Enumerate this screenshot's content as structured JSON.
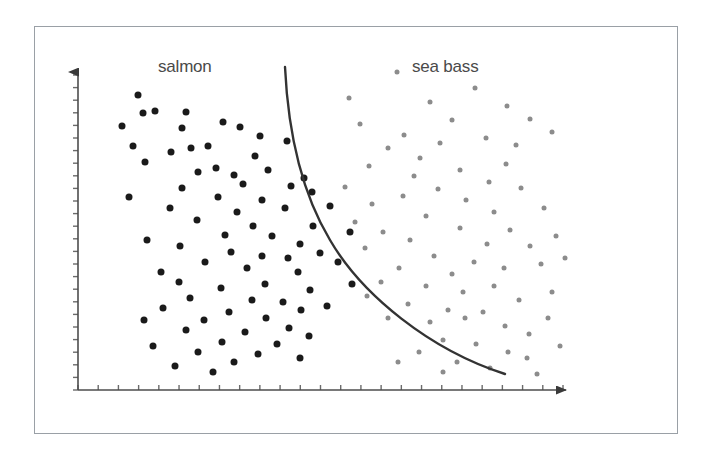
{
  "figure": {
    "title": "",
    "labels": {
      "salmon": "salmon",
      "sea_bass": "sea bass"
    },
    "colors": {
      "salmon_points": "#1a1a1a",
      "sea_bass_points": "#8c8c8c",
      "decision_boundary": "#333333",
      "axis": "#4d4d4d",
      "frame_border": "#9aa0a6",
      "background": "#ffffff",
      "label_text": "#4a4a4a"
    }
  },
  "chart_data": {
    "type": "scatter",
    "title": "",
    "xlabel": "",
    "ylabel": "",
    "grid": false,
    "legend_position": "in-plot-top",
    "axis_style": "arrow-axes-with-ticks",
    "xlim": [
      78,
      575
    ],
    "ylim": [
      63,
      390
    ],
    "annotations": [
      {
        "text": "salmon",
        "x": 188,
        "y": 66
      },
      {
        "text": "sea bass",
        "x": 448,
        "y": 66
      }
    ],
    "series": [
      {
        "name": "salmon",
        "color": "#1a1a1a",
        "marker": "circle",
        "marker_size": 7,
        "count": 78,
        "points": [
          [
            138,
            95
          ],
          [
            143,
            113
          ],
          [
            155,
            111
          ],
          [
            122,
            126
          ],
          [
            186,
            112
          ],
          [
            182,
            128
          ],
          [
            133,
            146
          ],
          [
            223,
            122
          ],
          [
            191,
            148
          ],
          [
            240,
            127
          ],
          [
            208,
            146
          ],
          [
            260,
            136
          ],
          [
            171,
            152
          ],
          [
            255,
            156
          ],
          [
            216,
            168
          ],
          [
            145,
            162
          ],
          [
            287,
            141
          ],
          [
            234,
            175
          ],
          [
            198,
            172
          ],
          [
            268,
            170
          ],
          [
            304,
            178
          ],
          [
            182,
            188
          ],
          [
            243,
            184
          ],
          [
            291,
            186
          ],
          [
            129,
            197
          ],
          [
            218,
            197
          ],
          [
            262,
            200
          ],
          [
            170,
            208
          ],
          [
            312,
            192
          ],
          [
            237,
            212
          ],
          [
            285,
            208
          ],
          [
            197,
            220
          ],
          [
            253,
            226
          ],
          [
            330,
            206
          ],
          [
            225,
            235
          ],
          [
            147,
            240
          ],
          [
            272,
            236
          ],
          [
            313,
            226
          ],
          [
            180,
            246
          ],
          [
            300,
            244
          ],
          [
            350,
            232
          ],
          [
            231,
            252
          ],
          [
            262,
            256
          ],
          [
            288,
            258
          ],
          [
            205,
            262
          ],
          [
            320,
            253
          ],
          [
            161,
            272
          ],
          [
            247,
            268
          ],
          [
            298,
            272
          ],
          [
            179,
            282
          ],
          [
            265,
            284
          ],
          [
            338,
            262
          ],
          [
            221,
            288
          ],
          [
            310,
            290
          ],
          [
            190,
            298
          ],
          [
            252,
            300
          ],
          [
            283,
            302
          ],
          [
            352,
            284
          ],
          [
            163,
            308
          ],
          [
            229,
            312
          ],
          [
            301,
            310
          ],
          [
            204,
            320
          ],
          [
            266,
            318
          ],
          [
            327,
            306
          ],
          [
            186,
            330
          ],
          [
            245,
            332
          ],
          [
            289,
            328
          ],
          [
            222,
            342
          ],
          [
            153,
            346
          ],
          [
            277,
            344
          ],
          [
            309,
            336
          ],
          [
            198,
            352
          ],
          [
            258,
            354
          ],
          [
            234,
            362
          ],
          [
            175,
            366
          ],
          [
            300,
            358
          ],
          [
            213,
            372
          ],
          [
            144,
            320
          ]
        ]
      },
      {
        "name": "sea bass",
        "color": "#8c8c8c",
        "marker": "circle",
        "marker_size": 5,
        "count": 72,
        "points": [
          [
            397,
            72
          ],
          [
            349,
            98
          ],
          [
            404,
            135
          ],
          [
            430,
            102
          ],
          [
            475,
            88
          ],
          [
            360,
            124
          ],
          [
            420,
            158
          ],
          [
            452,
            120
          ],
          [
            388,
            148
          ],
          [
            507,
            106
          ],
          [
            369,
            166
          ],
          [
            440,
            143
          ],
          [
            486,
            138
          ],
          [
            506,
            164
          ],
          [
            530,
            119
          ],
          [
            414,
            176
          ],
          [
            460,
            170
          ],
          [
            345,
            187
          ],
          [
            489,
            182
          ],
          [
            516,
            145
          ],
          [
            403,
            196
          ],
          [
            438,
            189
          ],
          [
            552,
            132
          ],
          [
            372,
            204
          ],
          [
            466,
            200
          ],
          [
            494,
            212
          ],
          [
            521,
            188
          ],
          [
            426,
            216
          ],
          [
            355,
            222
          ],
          [
            383,
            232
          ],
          [
            460,
            228
          ],
          [
            510,
            230
          ],
          [
            544,
            208
          ],
          [
            410,
            240
          ],
          [
            487,
            244
          ],
          [
            434,
            256
          ],
          [
            365,
            248
          ],
          [
            530,
            246
          ],
          [
            556,
            236
          ],
          [
            474,
            262
          ],
          [
            399,
            268
          ],
          [
            452,
            274
          ],
          [
            504,
            268
          ],
          [
            381,
            282
          ],
          [
            426,
            286
          ],
          [
            541,
            264
          ],
          [
            463,
            292
          ],
          [
            494,
            286
          ],
          [
            367,
            296
          ],
          [
            519,
            300
          ],
          [
            408,
            304
          ],
          [
            448,
            310
          ],
          [
            483,
            312
          ],
          [
            552,
            292
          ],
          [
            430,
            322
          ],
          [
            465,
            318
          ],
          [
            505,
            326
          ],
          [
            388,
            318
          ],
          [
            529,
            334
          ],
          [
            443,
            340
          ],
          [
            476,
            344
          ],
          [
            508,
            352
          ],
          [
            548,
            318
          ],
          [
            419,
            352
          ],
          [
            457,
            362
          ],
          [
            490,
            368
          ],
          [
            527,
            358
          ],
          [
            560,
            346
          ],
          [
            398,
            362
          ],
          [
            537,
            374
          ],
          [
            443,
            372
          ],
          [
            565,
            258
          ]
        ]
      }
    ],
    "decision_boundary": {
      "label": "decision boundary",
      "style": "solid",
      "color": "#333333",
      "width": 2.4,
      "path": "M 285 67 C 288 130, 300 190, 330 240 C 362 295, 430 350, 505 374"
    }
  },
  "axes": {
    "x_axis": {
      "x_start": 78,
      "x_end": 575,
      "y": 390,
      "arrow": true,
      "tick_count": 25,
      "tick_length": 5,
      "tick_side": "above"
    },
    "y_axis": {
      "x": 78,
      "y_start": 390,
      "y_end": 63,
      "arrow": true,
      "tick_count": 26,
      "tick_length": 5,
      "tick_side": "left"
    }
  }
}
